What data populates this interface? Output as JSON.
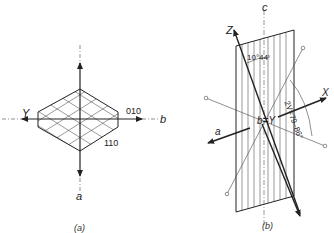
{
  "figure_a": {
    "caption": "(a)",
    "axis_labels": {
      "Y": "Y",
      "b": "b",
      "a": "a"
    },
    "face_labels": {
      "f010": "010",
      "f110": "110"
    }
  },
  "figure_b": {
    "caption": "(b)",
    "axis_labels": {
      "c": "c",
      "Z": "Z",
      "X": "X",
      "a": "a",
      "bY": "b=Y"
    },
    "angle_labels": {
      "a1": "10°44'",
      "a2": "2V=79–86°"
    }
  },
  "colors": {
    "line": "#222222",
    "hatch": "#555555",
    "background": "#ffffff"
  }
}
